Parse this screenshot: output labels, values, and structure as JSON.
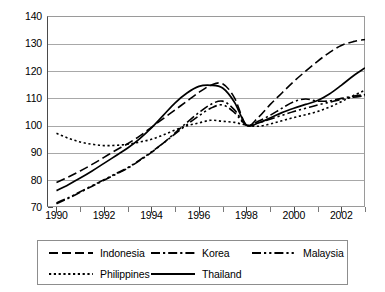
{
  "chart_data": {
    "type": "line",
    "title": "",
    "subtitle": "",
    "xlabel": "",
    "ylabel": "",
    "xlim": [
      1989.6,
      2003.0
    ],
    "ylim": [
      70,
      140
    ],
    "grid": true,
    "legend_position": "bottom",
    "y_ticks": [
      70,
      80,
      90,
      100,
      110,
      120,
      130,
      140
    ],
    "x_ticks": [
      1990,
      1991,
      1992,
      1993,
      1994,
      1995,
      1996,
      1997,
      1998,
      1999,
      2000,
      2001,
      2002,
      2003
    ],
    "x_tick_labels": [
      "1990",
      "",
      "1992",
      "",
      "1994",
      "",
      "1996",
      "",
      "1998",
      "",
      "2000",
      "",
      "2002",
      ""
    ],
    "x": [
      1990,
      1990.5,
      1991,
      1991.5,
      1992,
      1992.5,
      1993,
      1993.5,
      1994,
      1994.5,
      1995,
      1995.5,
      1996,
      1996.5,
      1997,
      1997.5,
      1998,
      1998.5,
      1999,
      1999.5,
      2000,
      2000.5,
      2001,
      2001.5,
      2002,
      2002.5,
      2003
    ],
    "series": [
      {
        "name": "Indonesia",
        "dash": "long-dash",
        "values": [
          79.0,
          81.0,
          83.2,
          85.6,
          88.2,
          90.8,
          93.2,
          96.0,
          99.2,
          102.4,
          105.6,
          108.8,
          112.0,
          114.6,
          115.2,
          110.0,
          100.0,
          102.8,
          107.5,
          111.8,
          116.0,
          119.8,
          123.4,
          126.6,
          129.2,
          130.6,
          131.4
        ]
      },
      {
        "name": "Korea",
        "dash": "dash-dot",
        "values": [
          71.2,
          73.2,
          75.4,
          77.6,
          79.8,
          82.0,
          84.2,
          87.0,
          90.0,
          93.4,
          97.2,
          101.0,
          104.6,
          107.6,
          108.8,
          105.6,
          100.0,
          101.4,
          103.6,
          106.2,
          108.6,
          109.6,
          108.8,
          108.9,
          109.8,
          110.6,
          111.2
        ]
      },
      {
        "name": "Malaysia",
        "dash": "dash-dot-dot",
        "values": [
          71.5,
          73.4,
          75.6,
          77.8,
          80.0,
          82.2,
          84.4,
          87.2,
          90.2,
          93.4,
          96.8,
          100.2,
          103.4,
          106.2,
          107.4,
          104.6,
          100.0,
          100.8,
          102.2,
          103.6,
          105.0,
          106.2,
          107.4,
          108.4,
          109.4,
          110.2,
          110.8
        ]
      },
      {
        "name": "Philippines",
        "dash": "dotted",
        "values": [
          97.0,
          95.2,
          93.8,
          93.0,
          92.5,
          92.6,
          93.0,
          93.8,
          94.8,
          96.4,
          98.2,
          99.8,
          100.8,
          101.8,
          101.4,
          101.0,
          100.0,
          99.6,
          100.4,
          101.6,
          102.8,
          103.8,
          105.0,
          106.6,
          108.6,
          110.8,
          112.8
        ]
      },
      {
        "name": "Thailand",
        "dash": "solid",
        "values": [
          76.0,
          78.2,
          80.6,
          83.2,
          86.0,
          88.8,
          91.6,
          95.0,
          99.0,
          103.6,
          108.2,
          111.8,
          114.2,
          114.6,
          113.6,
          108.4,
          100.0,
          100.8,
          102.6,
          104.6,
          106.2,
          107.6,
          109.0,
          111.4,
          114.6,
          118.0,
          121.0
        ]
      }
    ]
  },
  "legend": {
    "items": [
      {
        "label": "Indonesia"
      },
      {
        "label": "Korea"
      },
      {
        "label": "Malaysia"
      },
      {
        "label": "Philippines"
      },
      {
        "label": "Thailand"
      }
    ]
  },
  "colors": {
    "line": "#000000",
    "grid": "#a8a8a8",
    "axis": "#4a4a4a",
    "background": "#ffffff"
  }
}
